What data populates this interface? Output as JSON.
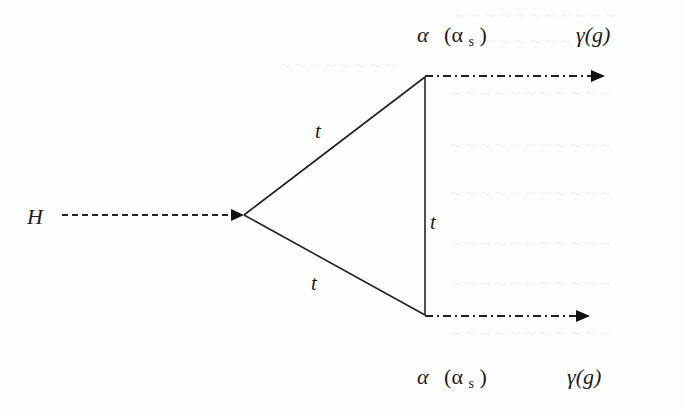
{
  "particles": {
    "incoming": {
      "label": "H",
      "line_style": "dashed",
      "name": "Higgs boson"
    },
    "loop": [
      {
        "id": "upper",
        "label": "t"
      },
      {
        "id": "right",
        "label": "t"
      },
      {
        "id": "lower",
        "label": "t"
      }
    ],
    "outgoing": [
      {
        "id": "upper",
        "coupling_main": "α",
        "coupling_paren_open": "(α",
        "coupling_sub": "s",
        "coupling_paren_close": ")",
        "boson_label": "γ(g)",
        "line_style": "dash-dot"
      },
      {
        "id": "lower",
        "coupling_main": "α",
        "coupling_paren_open": "(α",
        "coupling_sub": "s",
        "coupling_paren_close": ")",
        "boson_label": "γ(g)",
        "line_style": "dash-dot"
      }
    ]
  },
  "colors": {
    "ink": "#222222",
    "background": "#fdfdfd",
    "bleed_through": "#e9e9e9"
  }
}
